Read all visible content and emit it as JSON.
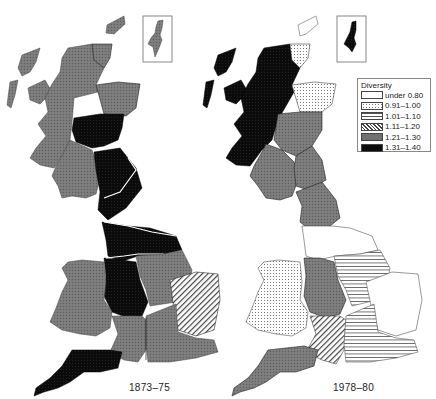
{
  "maps": [
    {
      "id": "map-1873",
      "label": "1873–75",
      "regions": [
        {
          "name": "north-scotland",
          "category": "1.21–1.30"
        },
        {
          "name": "north-east-scotland",
          "category": "1.21–1.30"
        },
        {
          "name": "orkney-caithness",
          "category": "1.21–1.30"
        },
        {
          "name": "east-central-scotland",
          "category": "1.31–1.40"
        },
        {
          "name": "south-west-scotland",
          "category": "1.21–1.30"
        },
        {
          "name": "northern-england",
          "category": "1.31–1.40"
        },
        {
          "name": "yorkshire",
          "category": "1.31–1.40"
        },
        {
          "name": "north-west-midlands",
          "category": "1.31–1.40"
        },
        {
          "name": "east-midlands",
          "category": "1.21–1.30"
        },
        {
          "name": "west-midlands",
          "category": "1.31–1.40"
        },
        {
          "name": "wales",
          "category": "1.21–1.30"
        },
        {
          "name": "east-anglia",
          "category": "1.11–1.20"
        },
        {
          "name": "south-central",
          "category": "1.21–1.30"
        },
        {
          "name": "south-east",
          "category": "1.21–1.30"
        },
        {
          "name": "south-west",
          "category": "1.31–1.40"
        },
        {
          "name": "shetland",
          "category": "1.21–1.30"
        }
      ]
    },
    {
      "id": "map-1978",
      "label": "1978–80",
      "regions": [
        {
          "name": "north-scotland",
          "category": "1.31–1.40"
        },
        {
          "name": "orkney-caithness",
          "category": "0.91–1.00"
        },
        {
          "name": "north-east-scotland",
          "category": "0.91–1.00"
        },
        {
          "name": "east-central-scotland",
          "category": "1.21–1.30"
        },
        {
          "name": "south-west-scotland",
          "category": "1.21–1.30"
        },
        {
          "name": "south-east-scotland",
          "category": "1.21–1.30"
        },
        {
          "name": "northern-england",
          "category": "1.21–1.30"
        },
        {
          "name": "yorkshire",
          "category": "under 0.80"
        },
        {
          "name": "west-midlands",
          "category": "1.21–1.30"
        },
        {
          "name": "east-midlands",
          "category": "1.01–1.10"
        },
        {
          "name": "wales",
          "category": "0.91–1.00"
        },
        {
          "name": "east-anglia",
          "category": "under 0.80"
        },
        {
          "name": "south-central",
          "category": "1.11–1.20"
        },
        {
          "name": "south-east",
          "category": "1.01–1.10"
        },
        {
          "name": "south-west",
          "category": "1.21–1.30"
        },
        {
          "name": "shetland",
          "category": "1.31–1.40"
        }
      ]
    }
  ],
  "legend": {
    "title": "Diversity",
    "items": [
      {
        "label": "under 0.80",
        "pattern": "blank",
        "fill": "#ffffff"
      },
      {
        "label": "0.91–1.00",
        "pattern": "dots",
        "fill": "#e6e6e6"
      },
      {
        "label": "1.01–1.10",
        "pattern": "horizontal-lines",
        "fill": "#f2f2f2"
      },
      {
        "label": "1.11–1.20",
        "pattern": "diagonal-hatch",
        "fill": "#bdbdbd"
      },
      {
        "label": "1.21–1.30",
        "pattern": "crosshatch-grey",
        "fill": "#6e6e6e"
      },
      {
        "label": "1.31–1.40",
        "pattern": "solid-black",
        "fill": "#0d0d0d"
      }
    ]
  }
}
